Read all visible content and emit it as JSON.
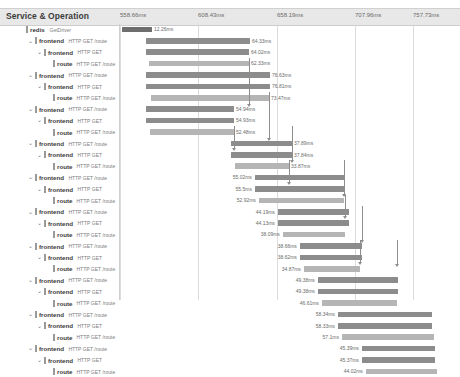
{
  "header": {
    "title": "Service & Operation",
    "ticks": [
      {
        "label": "558.66ms",
        "x": 120
      },
      {
        "label": "608.43ms",
        "x": 198
      },
      {
        "label": "658.19ms",
        "x": 277
      },
      {
        "label": "707.96ms",
        "x": 355
      },
      {
        "label": "757.73ms",
        "x": 413
      }
    ]
  },
  "colors": {
    "bar_dark": "#6e6e6e",
    "bar_mid": "#8c8c8c",
    "bar_light": "#b5b5b5",
    "header_bg": "#e8e8e8",
    "grid_line": "#dcdcdc",
    "arrow": "#8d8d8d"
  },
  "chart_data": {
    "type": "bar",
    "title": "Service & Operation",
    "xlabel": "",
    "ylabel": "",
    "axis_ticks": [
      "558.66ms",
      "608.43ms",
      "658.19ms",
      "707.96ms",
      "757.73ms"
    ],
    "axis_values_ms": [
      558.66,
      608.43,
      658.19,
      707.96,
      757.73
    ],
    "categories": [
      "redis GetDriver",
      "frontend HTTP GET /route",
      "frontend HTTP GET",
      "route HTTP GET /route",
      "frontend HTTP GET /route",
      "frontend HTTP GET",
      "route HTTP GET /route",
      "frontend HTTP GET /route",
      "frontend HTTP GET",
      "route HTTP GET /route",
      "frontend HTTP GET /route",
      "frontend HTTP GET",
      "route HTTP GET /route",
      "frontend HTTP GET /route",
      "frontend HTTP GET",
      "route HTTP GET /route",
      "frontend HTTP GET /route",
      "frontend HTTP GET",
      "route HTTP GET /route",
      "frontend HTTP GET /route",
      "frontend HTTP GET",
      "route HTTP GET /route",
      "frontend HTTP GET /route",
      "frontend HTTP GET",
      "route HTTP GET /route"
    ],
    "values": [
      12.26,
      64.33,
      64.02,
      62.33,
      76.63,
      76.81,
      73.47,
      54.94,
      54.93,
      52.48,
      37.89,
      37.84,
      33.87,
      55.02,
      55.5,
      52.92,
      44.19,
      44.13,
      38.09,
      38.66,
      38.62,
      34.87,
      49.38,
      49.38,
      46.61
    ]
  },
  "rows": [
    {
      "indent": 0,
      "chevron": "",
      "service": "redis",
      "operation": "GetDriver",
      "bar_left": 122,
      "bar_width": 30,
      "shade": "dark",
      "duration": "12.26ms",
      "dur_side": "right"
    },
    {
      "indent": 1,
      "chevron": "⌄",
      "service": "frontend",
      "operation": "HTTP GET /route",
      "bar_left": 146,
      "bar_width": 104,
      "shade": "mid",
      "duration": "64.33ms",
      "dur_side": "right"
    },
    {
      "indent": 2,
      "chevron": "⌄",
      "service": "frontend",
      "operation": "HTTP GET",
      "bar_left": 146,
      "bar_width": 103,
      "shade": "mid",
      "duration": "64.02ms",
      "dur_side": "right"
    },
    {
      "indent": 3,
      "chevron": "",
      "service": "route",
      "operation": "HTTP GET /route",
      "bar_left": 149,
      "bar_width": 100,
      "shade": "light",
      "duration": "62.33ms",
      "dur_side": "right"
    },
    {
      "indent": 1,
      "chevron": "⌄",
      "service": "frontend",
      "operation": "HTTP GET /route",
      "bar_left": 146,
      "bar_width": 124,
      "shade": "mid",
      "duration": "76.63ms",
      "dur_side": "right"
    },
    {
      "indent": 2,
      "chevron": "⌄",
      "service": "frontend",
      "operation": "HTTP GET",
      "bar_left": 146,
      "bar_width": 124,
      "shade": "mid",
      "duration": "76.81ms",
      "dur_side": "right"
    },
    {
      "indent": 3,
      "chevron": "",
      "service": "route",
      "operation": "HTTP GET /route",
      "bar_left": 151,
      "bar_width": 118,
      "shade": "light",
      "duration": "73.47ms",
      "dur_side": "right"
    },
    {
      "indent": 1,
      "chevron": "⌄",
      "service": "frontend",
      "operation": "HTTP GET /route",
      "bar_left": 146,
      "bar_width": 88,
      "shade": "mid",
      "duration": "54.94ms",
      "dur_side": "right"
    },
    {
      "indent": 2,
      "chevron": "⌄",
      "service": "frontend",
      "operation": "HTTP GET",
      "bar_left": 146,
      "bar_width": 88,
      "shade": "mid",
      "duration": "54.93ms",
      "dur_side": "right"
    },
    {
      "indent": 3,
      "chevron": "",
      "service": "route",
      "operation": "HTTP GET /route",
      "bar_left": 150,
      "bar_width": 84,
      "shade": "light",
      "duration": "52.48ms",
      "dur_side": "right"
    },
    {
      "indent": 1,
      "chevron": "⌄",
      "service": "frontend",
      "operation": "HTTP GET /route",
      "bar_left": 231,
      "bar_width": 61,
      "shade": "mid",
      "duration": "37.89ms",
      "dur_side": "right"
    },
    {
      "indent": 2,
      "chevron": "⌄",
      "service": "frontend",
      "operation": "HTTP GET",
      "bar_left": 231,
      "bar_width": 61,
      "shade": "mid",
      "duration": "37.84ms",
      "dur_side": "right"
    },
    {
      "indent": 3,
      "chevron": "",
      "service": "route",
      "operation": "HTTP GET /route",
      "bar_left": 235,
      "bar_width": 54,
      "shade": "light",
      "duration": "33.87ms",
      "dur_side": "right"
    },
    {
      "indent": 1,
      "chevron": "⌄",
      "service": "frontend",
      "operation": "HTTP GET /route",
      "bar_left": 255,
      "bar_width": 89,
      "shade": "mid",
      "duration": "55.02ms",
      "dur_side": "left"
    },
    {
      "indent": 2,
      "chevron": "⌄",
      "service": "frontend",
      "operation": "HTTP GET",
      "bar_left": 255,
      "bar_width": 89,
      "shade": "mid",
      "duration": "55.5ms",
      "dur_side": "left"
    },
    {
      "indent": 3,
      "chevron": "",
      "service": "route",
      "operation": "HTTP GET /route",
      "bar_left": 259,
      "bar_width": 85,
      "shade": "light",
      "duration": "52.92ms",
      "dur_side": "left"
    },
    {
      "indent": 1,
      "chevron": "⌄",
      "service": "frontend",
      "operation": "HTTP GET /route",
      "bar_left": 278,
      "bar_width": 71,
      "shade": "mid",
      "duration": "44.19ms",
      "dur_side": "left"
    },
    {
      "indent": 2,
      "chevron": "⌄",
      "service": "frontend",
      "operation": "HTTP GET",
      "bar_left": 278,
      "bar_width": 71,
      "shade": "mid",
      "duration": "44.13ms",
      "dur_side": "left"
    },
    {
      "indent": 3,
      "chevron": "",
      "service": "route",
      "operation": "HTTP GET /route",
      "bar_left": 283,
      "bar_width": 62,
      "shade": "light",
      "duration": "38.09ms",
      "dur_side": "left"
    },
    {
      "indent": 1,
      "chevron": "⌄",
      "service": "frontend",
      "operation": "HTTP GET /route",
      "bar_left": 300,
      "bar_width": 62,
      "shade": "mid",
      "duration": "38.66ms",
      "dur_side": "left"
    },
    {
      "indent": 2,
      "chevron": "⌄",
      "service": "frontend",
      "operation": "HTTP GET",
      "bar_left": 300,
      "bar_width": 62,
      "shade": "mid",
      "duration": "38.62ms",
      "dur_side": "left"
    },
    {
      "indent": 3,
      "chevron": "",
      "service": "route",
      "operation": "HTTP GET /route",
      "bar_left": 304,
      "bar_width": 56,
      "shade": "light",
      "duration": "34.87ms",
      "dur_side": "left"
    },
    {
      "indent": 1,
      "chevron": "⌄",
      "service": "frontend",
      "operation": "HTTP GET /route",
      "bar_left": 318,
      "bar_width": 80,
      "shade": "mid",
      "duration": "49.38ms",
      "dur_side": "left"
    },
    {
      "indent": 2,
      "chevron": "⌄",
      "service": "frontend",
      "operation": "HTTP GET",
      "bar_left": 318,
      "bar_width": 80,
      "shade": "mid",
      "duration": "49.38ms",
      "dur_side": "left"
    },
    {
      "indent": 3,
      "chevron": "",
      "service": "route",
      "operation": "HTTP GET /route",
      "bar_left": 322,
      "bar_width": 75,
      "shade": "light",
      "duration": "46.61ms",
      "dur_side": "left"
    },
    {
      "indent": 1,
      "chevron": "⌄",
      "service": "frontend",
      "operation": "HTTP GET /route",
      "bar_left": 338,
      "bar_width": 94,
      "shade": "mid",
      "duration": "58.34ms",
      "dur_side": "left"
    },
    {
      "indent": 2,
      "chevron": "⌄",
      "service": "frontend",
      "operation": "HTTP GET",
      "bar_left": 338,
      "bar_width": 94,
      "shade": "mid",
      "duration": "58.33ms",
      "dur_side": "left"
    },
    {
      "indent": 3,
      "chevron": "",
      "service": "route",
      "operation": "HTTP GET /route",
      "bar_left": 342,
      "bar_width": 92,
      "shade": "light",
      "duration": "57.1ms",
      "dur_side": "left"
    },
    {
      "indent": 1,
      "chevron": "⌄",
      "service": "frontend",
      "operation": "HTTP GET /route",
      "bar_left": 362,
      "bar_width": 73,
      "shade": "mid",
      "duration": "45.39ms",
      "dur_side": "left"
    },
    {
      "indent": 2,
      "chevron": "⌄",
      "service": "frontend",
      "operation": "HTTP GET",
      "bar_left": 362,
      "bar_width": 73,
      "shade": "mid",
      "duration": "45.37ms",
      "dur_side": "left"
    },
    {
      "indent": 3,
      "chevron": "",
      "service": "route",
      "operation": "HTTP GET /route",
      "bar_left": 366,
      "bar_width": 71,
      "shade": "light",
      "duration": "44.02ms",
      "dur_side": "left"
    }
  ],
  "arrows": [
    {
      "x": 249,
      "top": 34,
      "height": 46
    },
    {
      "x": 269,
      "top": 68,
      "height": 46
    },
    {
      "x": 234,
      "top": 102,
      "height": 22
    },
    {
      "x": 292,
      "top": 102,
      "height": 34
    },
    {
      "x": 289,
      "top": 136,
      "height": 22
    },
    {
      "x": 344,
      "top": 136,
      "height": 34
    },
    {
      "x": 345,
      "top": 170,
      "height": 22
    },
    {
      "x": 362,
      "top": 182,
      "height": 34
    },
    {
      "x": 360,
      "top": 216,
      "height": 22
    },
    {
      "x": 397,
      "top": 216,
      "height": 24
    }
  ]
}
